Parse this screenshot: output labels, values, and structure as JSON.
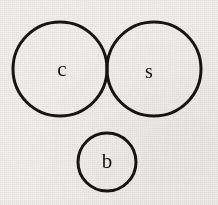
{
  "diagram": {
    "background_color": "#efeeec",
    "stroke_color": "#151515",
    "label_color": "#141414",
    "stroke_width": 3,
    "nodes": [
      {
        "id": "c",
        "label": "c",
        "name": "circle-c",
        "cx": 60,
        "cy": 69,
        "r": 47,
        "label_x": 62,
        "label_y": 71,
        "label_size": 21
      },
      {
        "id": "s",
        "label": "s",
        "name": "circle-s",
        "cx": 154,
        "cy": 69,
        "r": 47,
        "label_x": 149,
        "label_y": 73,
        "label_size": 20
      },
      {
        "id": "b",
        "label": "b",
        "name": "circle-b",
        "cx": 107,
        "cy": 162,
        "r": 29,
        "label_x": 107,
        "label_y": 163,
        "label_size": 21
      }
    ],
    "overlaps": [
      {
        "between": [
          "c",
          "s"
        ],
        "kind": "intersecting"
      },
      {
        "between": [
          "c",
          "b"
        ],
        "kind": "disjoint"
      },
      {
        "between": [
          "s",
          "b"
        ],
        "kind": "disjoint"
      }
    ]
  }
}
